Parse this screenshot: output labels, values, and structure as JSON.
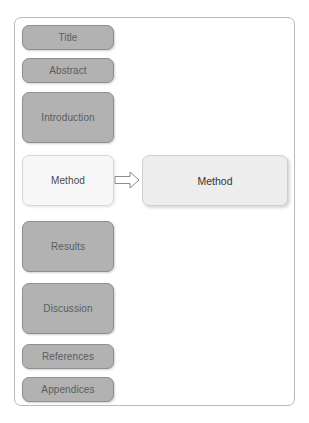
{
  "diagram": {
    "title_text": "",
    "colors": {
      "section_fill": "#b2b2b2",
      "section_border": "#8f8f8f",
      "section_text": "#5c5c5c",
      "selected_fill": "#f7f7f7",
      "selected_border": "#d8d8d8",
      "detail_fill": "#ededed",
      "detail_border": "#cfcfcf",
      "frame_border": "#b9b9b9",
      "page_background": "#ffffff"
    },
    "sections": [
      {
        "label": "Title",
        "selected": false
      },
      {
        "label": "Abstract",
        "selected": false
      },
      {
        "label": "Introduction",
        "selected": false
      },
      {
        "label": "Method",
        "selected": true
      },
      {
        "label": "Results",
        "selected": false
      },
      {
        "label": "Discussion",
        "selected": false
      },
      {
        "label": "References",
        "selected": false
      },
      {
        "label": "Appendices",
        "selected": false
      }
    ],
    "arrow": {
      "icon": "arrow-right-outline-icon",
      "direction": "right"
    },
    "detail_panel": {
      "label": "Method"
    }
  }
}
